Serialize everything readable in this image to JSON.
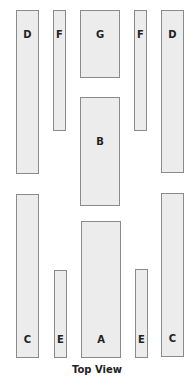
{
  "diagram": {
    "caption": "Top View",
    "colors": {
      "fill": "#ececec",
      "stroke": "#8a8a8a",
      "text": "#222222"
    },
    "pieces": [
      {
        "id": "d-left",
        "label": "D",
        "x": 16,
        "y": 10,
        "w": 23,
        "h": 164,
        "label_pos": "top"
      },
      {
        "id": "f-left",
        "label": "F",
        "x": 53,
        "y": 10,
        "w": 13,
        "h": 121,
        "label_pos": "top"
      },
      {
        "id": "g",
        "label": "G",
        "x": 80,
        "y": 10,
        "w": 40,
        "h": 68,
        "label_pos": "top"
      },
      {
        "id": "f-right",
        "label": "F",
        "x": 134,
        "y": 10,
        "w": 13,
        "h": 121,
        "label_pos": "top"
      },
      {
        "id": "d-right",
        "label": "D",
        "x": 161,
        "y": 10,
        "w": 23,
        "h": 163,
        "label_pos": "top"
      },
      {
        "id": "b",
        "label": "B",
        "x": 80,
        "y": 97,
        "w": 40,
        "h": 109,
        "label_pos": "middle"
      },
      {
        "id": "c-left",
        "label": "C",
        "x": 16,
        "y": 194,
        "w": 23,
        "h": 164,
        "label_pos": "bottom"
      },
      {
        "id": "e-left",
        "label": "E",
        "x": 54,
        "y": 270,
        "w": 13,
        "h": 88,
        "label_pos": "bottom"
      },
      {
        "id": "a",
        "label": "A",
        "x": 81,
        "y": 221,
        "w": 40,
        "h": 137,
        "label_pos": "bottom"
      },
      {
        "id": "e-right",
        "label": "E",
        "x": 135,
        "y": 269,
        "w": 13,
        "h": 89,
        "label_pos": "bottom"
      },
      {
        "id": "c-right",
        "label": "C",
        "x": 161,
        "y": 193,
        "w": 23,
        "h": 164,
        "label_pos": "bottom"
      }
    ]
  }
}
